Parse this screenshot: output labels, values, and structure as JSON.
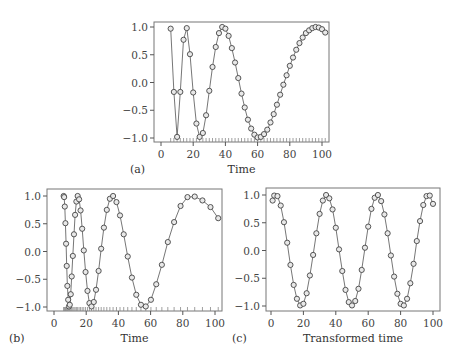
{
  "chart_data": [
    {
      "id": "a",
      "type": "line",
      "panel_label": "(a)",
      "xlabel": "Time",
      "ylabel": "",
      "xlim": [
        0,
        100
      ],
      "ylim": [
        -1.0,
        1.0
      ],
      "xticks": [
        0,
        20,
        40,
        60,
        80,
        100
      ],
      "yticks": [
        -1.0,
        -0.5,
        0.0,
        0.5,
        1.0
      ],
      "ytick_labels": [
        "−1.0",
        "−0.5",
        "0.0",
        "0.5",
        "1.0"
      ],
      "markers": "circle",
      "rug": true,
      "frame": {
        "left": 154,
        "right": 329,
        "top": 22,
        "bottom": 142,
        "x0px": 161,
        "x100px": 322,
        "y1px": 27,
        "ym1px": 138
      },
      "x": [
        6,
        8,
        10,
        12,
        14,
        16,
        18,
        20,
        22,
        24,
        26,
        28,
        30,
        32,
        34,
        36,
        38,
        40,
        42,
        44,
        46,
        48,
        50,
        52,
        54,
        56,
        58,
        60,
        62,
        64,
        66,
        68,
        70,
        72,
        74,
        76,
        78,
        80,
        82,
        84,
        86,
        88,
        90,
        92,
        94,
        96,
        98,
        100,
        102
      ],
      "values": [
        0.97,
        -0.17,
        -0.98,
        -0.17,
        0.77,
        0.98,
        0.51,
        -0.18,
        -0.74,
        -0.98,
        -0.91,
        -0.59,
        -0.15,
        0.28,
        0.64,
        0.89,
        1.0,
        0.97,
        0.84,
        0.62,
        0.36,
        0.08,
        -0.2,
        -0.45,
        -0.67,
        -0.83,
        -0.94,
        -0.99,
        -0.98,
        -0.93,
        -0.85,
        -0.72,
        -0.57,
        -0.4,
        -0.22,
        -0.04,
        0.13,
        0.3,
        0.45,
        0.59,
        0.71,
        0.81,
        0.89,
        0.94,
        0.98,
        1.0,
        0.99,
        0.96,
        0.9
      ]
    },
    {
      "id": "b",
      "type": "line",
      "panel_label": "(b)",
      "xlabel": "Time",
      "ylabel": "",
      "xlim": [
        0,
        100
      ],
      "ylim": [
        -1.0,
        1.0
      ],
      "xticks": [
        0,
        20,
        40,
        60,
        80,
        100
      ],
      "yticks": [
        -1.0,
        -0.5,
        0.0,
        0.5,
        1.0
      ],
      "ytick_labels": [
        "−1.0",
        "−0.5",
        "0.0",
        "0.5",
        "1.0"
      ],
      "markers": "circle",
      "rug": true,
      "frame": {
        "left": 47,
        "right": 222,
        "top": 189,
        "bottom": 311,
        "x0px": 54,
        "x100px": 215,
        "y1px": 196,
        "ym1px": 307
      },
      "x": [
        6,
        6.3,
        6.7,
        7.1,
        7.5,
        7.9,
        8.3,
        8.8,
        9.3,
        9.8,
        10.4,
        11,
        11.7,
        12.4,
        13.1,
        13.9,
        14.7,
        15.6,
        16.5,
        17.5,
        18.5,
        19.6,
        20.8,
        22,
        23.3,
        24.7,
        26.1,
        27.7,
        29.3,
        31,
        32.8,
        34.7,
        36.7,
        38.8,
        41,
        43.3,
        45.8,
        48.4,
        51.1,
        54,
        57,
        60.2,
        63.5,
        67,
        70.7,
        74.6,
        78.6,
        82.9,
        87.4,
        92.2,
        97.2,
        102
      ],
      "values": [
        1.0,
        0.98,
        0.81,
        0.51,
        0.14,
        -0.26,
        -0.62,
        -0.87,
        -0.99,
        -0.96,
        -0.77,
        -0.45,
        -0.08,
        0.31,
        0.66,
        0.9,
        1.0,
        0.94,
        0.74,
        0.41,
        0.02,
        -0.37,
        -0.71,
        -0.93,
        -0.99,
        -0.91,
        -0.69,
        -0.35,
        0.05,
        0.43,
        0.75,
        0.95,
        1.0,
        0.89,
        0.65,
        0.31,
        -0.09,
        -0.47,
        -0.78,
        -0.96,
        -0.99,
        -0.87,
        -0.59,
        -0.24,
        0.17,
        0.53,
        0.82,
        0.98,
        0.99,
        0.92,
        0.8,
        0.6
      ]
    },
    {
      "id": "c",
      "type": "line",
      "panel_label": "(c)",
      "xlabel": "Transformed time",
      "ylabel": "",
      "xlim": [
        0,
        100
      ],
      "ylim": [
        -1.0,
        1.0
      ],
      "xticks": [
        0,
        20,
        40,
        60,
        80,
        100
      ],
      "yticks": [
        -1.0,
        -0.5,
        0.0,
        0.5,
        1.0
      ],
      "ytick_labels": [
        "−1.0",
        "−0.5",
        "0.0",
        "0.5",
        "1.0"
      ],
      "markers": "circle",
      "rug": false,
      "frame": {
        "left": 266,
        "right": 440,
        "top": 188,
        "bottom": 311,
        "x0px": 271,
        "x100px": 433,
        "y1px": 195,
        "ym1px": 306
      },
      "x": [
        1,
        2,
        4,
        6,
        8,
        10,
        12,
        14,
        16,
        18,
        20,
        22,
        24,
        26,
        28,
        30,
        32,
        34,
        36,
        38,
        40,
        42,
        44,
        46,
        48,
        50,
        52,
        54,
        56,
        58,
        60,
        62,
        64,
        66,
        68,
        70,
        72,
        74,
        76,
        78,
        80,
        82,
        84,
        86,
        88,
        90,
        92,
        94,
        96,
        98,
        100
      ],
      "values": [
        0.9,
        0.99,
        0.98,
        0.81,
        0.51,
        0.14,
        -0.26,
        -0.62,
        -0.87,
        -0.99,
        -0.96,
        -0.77,
        -0.45,
        -0.08,
        0.31,
        0.66,
        0.9,
        1.0,
        0.94,
        0.74,
        0.41,
        0.02,
        -0.37,
        -0.71,
        -0.93,
        -0.99,
        -0.91,
        -0.69,
        -0.35,
        0.05,
        0.43,
        0.75,
        0.95,
        1.0,
        0.89,
        0.65,
        0.31,
        -0.09,
        -0.47,
        -0.78,
        -0.96,
        -0.99,
        -0.87,
        -0.59,
        -0.24,
        0.17,
        0.53,
        0.82,
        0.98,
        0.99,
        0.84
      ]
    }
  ]
}
